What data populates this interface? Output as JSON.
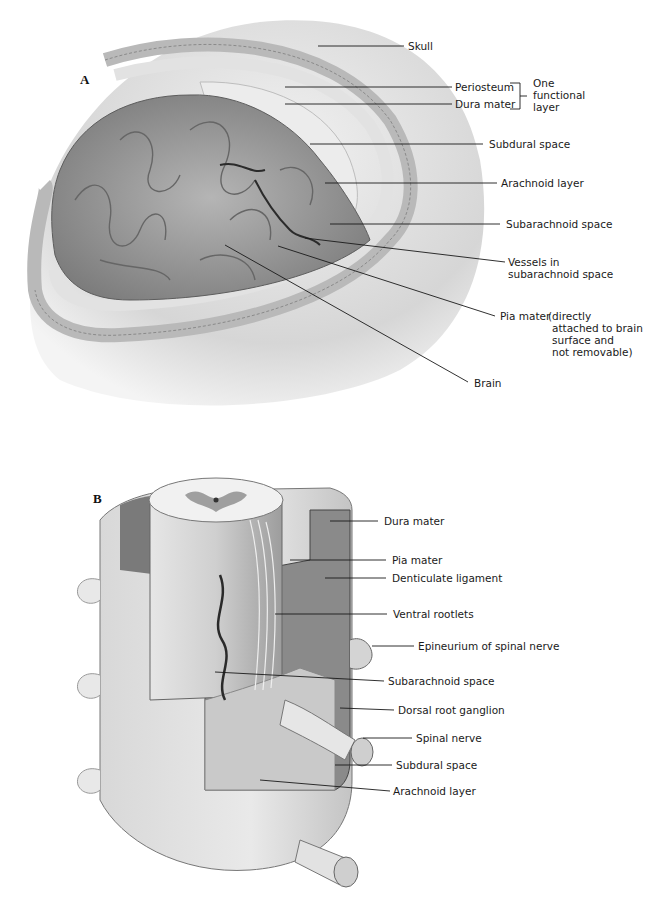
{
  "figure": {
    "panel_a": {
      "letter": "A",
      "labels": {
        "skull": "Skull",
        "periosteum": "Periosteum",
        "dura_mater": "Dura mater",
        "one_functional_layer": [
          "One",
          "functional",
          "layer"
        ],
        "subdural_space": "Subdural space",
        "arachnoid_layer": "Arachnoid layer",
        "subarachnoid_space": "Subarachnoid space",
        "vessels": [
          "Vessels in",
          "subarachnoid space"
        ],
        "pia_mater": "Pia mater",
        "pia_note": [
          "(directly",
          "attached to brain",
          "surface and",
          "not removable)"
        ],
        "brain": "Brain"
      }
    },
    "panel_b": {
      "letter": "B",
      "labels": {
        "dura_mater": "Dura mater",
        "pia_mater": "Pia mater",
        "denticulate_ligament": "Denticulate ligament",
        "ventral_rootlets": "Ventral rootlets",
        "epineurium": "Epineurium of spinal nerve",
        "subarachnoid_space": "Subarachnoid space",
        "dorsal_root_ganglion": "Dorsal root ganglion",
        "spinal_nerve": "Spinal nerve",
        "subdural_space": "Subdural space",
        "arachnoid_layer": "Arachnoid layer"
      }
    },
    "colors": {
      "line": "#1a1a1a",
      "skull": "#d9d9d9",
      "brain": "#9a9a9a",
      "membrane": "#e6e6e6",
      "cord_dark": "#7d7d7d"
    }
  }
}
